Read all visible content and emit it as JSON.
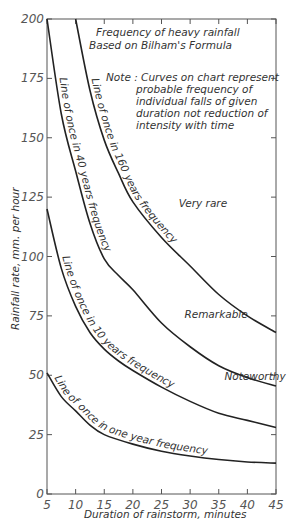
{
  "chart_data": {
    "type": "line",
    "title": "Frequency of heavy rainfall",
    "subtitle": "Based on Bilham's Formula",
    "note": [
      "Note : Curves on chart represent",
      "probable frequency of",
      "individual falls of given",
      "duration not reduction of",
      "intensity with time"
    ],
    "xlabel": "Duration of rainstorm, minutes",
    "ylabel": "Rainfall rate, mm. per hour",
    "xlim": [
      5,
      45
    ],
    "ylim": [
      0,
      200
    ],
    "x_ticks": [
      5,
      10,
      15,
      20,
      25,
      30,
      35,
      40,
      45
    ],
    "y_ticks": [
      0,
      25,
      50,
      75,
      100,
      125,
      150,
      175,
      200
    ],
    "grid": false,
    "series": [
      {
        "name": "Line of once in 160 years frequency",
        "x": [
          10,
          12.5,
          15,
          17.5,
          20,
          25,
          30,
          35,
          40,
          45
        ],
        "values": [
          200,
          170,
          149,
          135,
          123,
          108,
          96,
          84,
          75,
          68
        ]
      },
      {
        "name": "Line of once in 40 years frequency",
        "x": [
          5,
          7.5,
          10,
          12.5,
          15,
          17.5,
          20,
          25,
          30,
          35,
          40,
          45
        ],
        "values": [
          200,
          160,
          136,
          114,
          99,
          92,
          86,
          72,
          62,
          54,
          49,
          45.5
        ]
      },
      {
        "name": "Line of once in 10 years frequency",
        "x": [
          5,
          7.5,
          10,
          12.5,
          15,
          17.5,
          20,
          25,
          30,
          35,
          40,
          45
        ],
        "values": [
          120,
          95,
          79,
          68,
          61,
          56,
          52,
          45,
          39,
          34,
          31,
          28
        ]
      },
      {
        "name": "Line of once in one year frequency",
        "x": [
          5,
          7.5,
          10,
          12.5,
          15,
          20,
          25,
          30,
          35,
          40,
          45
        ],
        "values": [
          51,
          41,
          35,
          29,
          25,
          21,
          18,
          16,
          14.5,
          13.5,
          13
        ]
      }
    ],
    "annotations": [
      {
        "text": "Very rare",
        "x": 28,
        "y": 121
      },
      {
        "text": "Remarkable",
        "x": 29,
        "y": 74
      },
      {
        "text": "Noteworthy",
        "x": 36,
        "y": 48
      }
    ],
    "curve_labels": [
      {
        "text": "Line of once in 160 years frequency",
        "series": 0
      },
      {
        "text": "Line of once in 40 years frequency",
        "series": 1
      },
      {
        "text": "Line of once in 10 years frequency",
        "series": 2
      },
      {
        "text": "Line of once in one year frequency",
        "series": 3
      }
    ]
  }
}
